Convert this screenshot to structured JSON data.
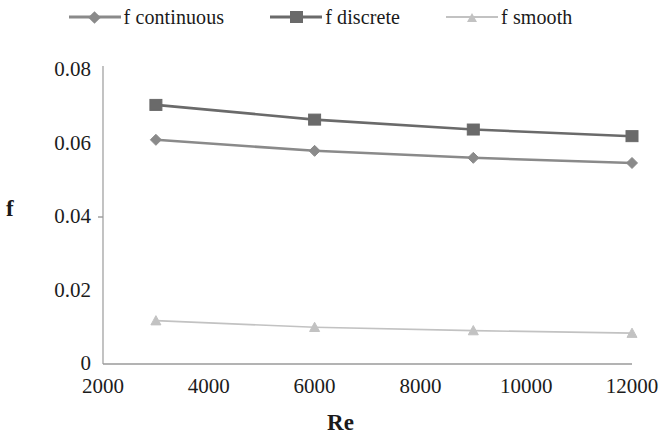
{
  "chart_data": {
    "type": "line",
    "title": "",
    "xlabel": "Re",
    "ylabel": "f",
    "x": [
      3000,
      6000,
      9000,
      12000
    ],
    "xlim": [
      2000,
      12000
    ],
    "ylim": [
      0,
      0.08
    ],
    "grid": false,
    "legend_position": "top",
    "xticks": [
      "2000",
      "4000",
      "6000",
      "8000",
      "10000",
      "12000"
    ],
    "xtick_values": [
      2000,
      4000,
      6000,
      8000,
      10000,
      12000
    ],
    "yticks": [
      "0",
      "0.02",
      "0.04",
      "0.06",
      "0.08"
    ],
    "ytick_values": [
      0,
      0.02,
      0.04,
      0.06,
      0.08
    ],
    "series": [
      {
        "name": "f continuous",
        "marker": "diamond",
        "color": "#8a8a8a",
        "values": [
          0.061,
          0.058,
          0.0561,
          0.0547
        ]
      },
      {
        "name": "f discrete",
        "marker": "square",
        "color": "#6a6a6a",
        "values": [
          0.0705,
          0.0665,
          0.0638,
          0.062
        ]
      },
      {
        "name": "f smooth",
        "marker": "triangle",
        "color": "#c2c2c2",
        "values": [
          0.0118,
          0.01,
          0.0091,
          0.0084
        ]
      }
    ]
  },
  "legend": {
    "items": [
      {
        "label": "f continuous",
        "marker": "diamond-marker",
        "color": "#8a8a8a"
      },
      {
        "label": "f discrete",
        "marker": "square-marker",
        "color": "#6a6a6a"
      },
      {
        "label": "f smooth",
        "marker": "triangle-marker",
        "color": "#c2c2c2"
      }
    ]
  },
  "axes": {
    "x_title": "Re",
    "y_title": "f",
    "axis_color": "#9a9a9a"
  }
}
